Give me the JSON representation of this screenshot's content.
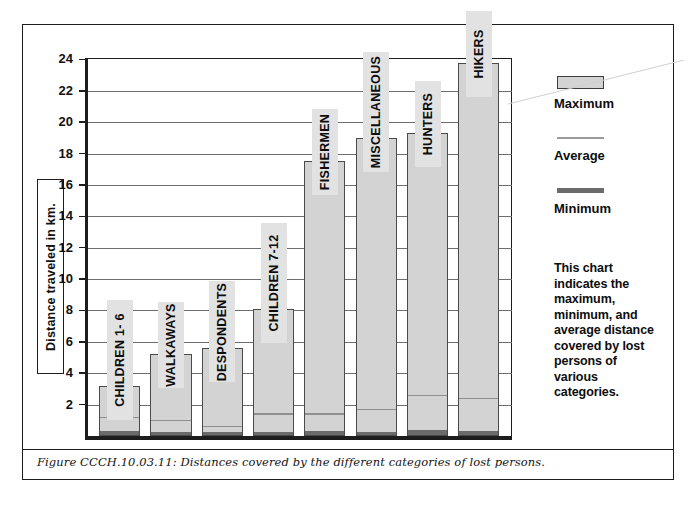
{
  "figure": {
    "caption": "Figure CCCH.10.03.11:  Distances covered by the different categories of lost persons."
  },
  "legend": {
    "maximum_label": "Maximum",
    "average_label": "Average",
    "minimum_label": "Minimum",
    "maximum_color": "#d3d3d3",
    "average_color": "#9a9a9a",
    "minimum_color": "#6b6b6b"
  },
  "description": {
    "text": "This chart indicates the maximum, minimum, and average distance covered by lost persons of various categories."
  },
  "chart_data": {
    "type": "bar",
    "title": "",
    "xlabel": "",
    "ylabel": "Distance traveled in km.",
    "ylim": [
      0,
      24
    ],
    "yticks": [
      2,
      4,
      6,
      8,
      10,
      12,
      14,
      16,
      18,
      20,
      22,
      24
    ],
    "grid": true,
    "legend_position": "right",
    "categories": [
      "CHILDREN 1- 6",
      "WALKAWAYS",
      "DESPONDENTS",
      "CHILDREN 7-12",
      "FISHERMEN",
      "MISCELLANEOUS",
      "HUNTERS",
      "HIKERS"
    ],
    "series": [
      {
        "name": "Maximum",
        "values": [
          3.2,
          5.2,
          5.6,
          8.1,
          17.5,
          19.0,
          19.3,
          23.8
        ]
      },
      {
        "name": "Average",
        "values": [
          1.3,
          1.1,
          0.7,
          1.5,
          1.5,
          1.8,
          2.7,
          2.5
        ]
      },
      {
        "name": "Minimum",
        "values": [
          0.25,
          0.2,
          0.2,
          0.2,
          0.25,
          0.2,
          0.3,
          0.25
        ]
      }
    ]
  }
}
